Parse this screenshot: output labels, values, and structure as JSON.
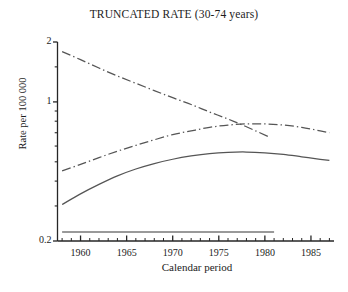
{
  "chart_data": {
    "type": "line",
    "title": "TRUNCATED RATE (30-74 years)",
    "xlabel": "Calendar period",
    "ylabel": "Rate per 100 000",
    "xlim": [
      1957.5,
      1987.5
    ],
    "ylim": [
      0.2,
      2
    ],
    "yscale": "log",
    "grid": false,
    "legend": "none",
    "xticks": [
      1960,
      1965,
      1970,
      1975,
      1980,
      1985
    ],
    "xtick_labels": [
      "1960",
      "1965",
      "1970",
      "1975",
      "1980",
      "1985"
    ],
    "xminor_tick_interval": 1,
    "yticks": [
      0.2,
      1,
      2
    ],
    "ytick_labels": [
      "0.2",
      "1",
      "2"
    ],
    "yminor_ticks": [
      0.3,
      0.4,
      0.5,
      0.6,
      0.7,
      0.8,
      0.9,
      1.5
    ],
    "series": [
      {
        "name": "descending-dashdot-curve",
        "style": "dash-dot",
        "color": "#555555",
        "x": [
          1958.0,
          1960.0,
          1962.0,
          1964.0,
          1966.0,
          1968.0,
          1970.0,
          1972.0,
          1974.0,
          1976.0,
          1978.0,
          1980.5
        ],
        "y": [
          1.79,
          1.63,
          1.48,
          1.35,
          1.24,
          1.14,
          1.05,
          0.97,
          0.89,
          0.82,
          0.75,
          0.665
        ]
      },
      {
        "name": "rising-dashdot-curve",
        "style": "dash-dot",
        "color": "#555555",
        "x": [
          1958.0,
          1960.0,
          1962.0,
          1964.0,
          1966.0,
          1968.0,
          1970.0,
          1972.0,
          1974.0,
          1976.0,
          1978.0,
          1980.0,
          1982.0,
          1984.0,
          1986.0,
          1987.0
        ],
        "y": [
          0.45,
          0.485,
          0.525,
          0.565,
          0.605,
          0.645,
          0.685,
          0.715,
          0.745,
          0.765,
          0.775,
          0.775,
          0.765,
          0.745,
          0.715,
          0.7
        ]
      },
      {
        "name": "solid-curve",
        "style": "solid",
        "color": "#555555",
        "x": [
          1958.0,
          1960.0,
          1962.0,
          1964.0,
          1966.0,
          1968.0,
          1970.0,
          1972.0,
          1974.0,
          1976.0,
          1978.0,
          1980.0,
          1982.0,
          1984.0,
          1986.0,
          1987.0
        ],
        "y": [
          0.305,
          0.345,
          0.385,
          0.425,
          0.46,
          0.49,
          0.515,
          0.535,
          0.55,
          0.558,
          0.56,
          0.555,
          0.545,
          0.53,
          0.515,
          0.508
        ]
      },
      {
        "name": "flat-baseline",
        "style": "solid",
        "color": "#777777",
        "x": [
          1958.0,
          1981.0
        ],
        "y": [
          0.222,
          0.222
        ]
      }
    ]
  }
}
